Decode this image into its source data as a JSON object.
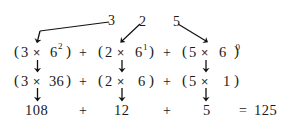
{
  "figure": {
    "colors": {
      "ink": "#1a1a1a",
      "background": "#ffffff",
      "arrow": "#111111"
    },
    "source_digits": [
      {
        "label": "3",
        "place": "sixes-squared"
      },
      {
        "label": "2",
        "place": "sixes"
      },
      {
        "label": "5",
        "place": "ones"
      }
    ],
    "row_power": {
      "terms": [
        {
          "open": "(",
          "coefficient": "3",
          "operator": "×",
          "base": "6",
          "exponent": "2",
          "close": ")"
        },
        {
          "open": "(",
          "coefficient": "2",
          "operator": "×",
          "base": "6",
          "exponent": "1",
          "close": ")"
        },
        {
          "open": "(",
          "coefficient": "5",
          "operator": "×",
          "base": "6",
          "exponent": "0",
          "close": ")"
        }
      ],
      "separators": [
        "+",
        "+"
      ]
    },
    "row_expanded": {
      "terms": [
        {
          "open": "(",
          "coefficient": "3",
          "operator": "×",
          "value": "36",
          "close": ")"
        },
        {
          "open": "(",
          "coefficient": "2",
          "operator": "×",
          "value": "6",
          "close": ")"
        },
        {
          "open": "(",
          "coefficient": "5",
          "operator": "×",
          "value": "1",
          "close": ")"
        }
      ],
      "separators": [
        "+",
        "+"
      ]
    },
    "row_products": {
      "values": [
        "108",
        "12",
        "5"
      ],
      "separators": [
        "+",
        "+"
      ],
      "equals": "=",
      "total": "125"
    }
  }
}
